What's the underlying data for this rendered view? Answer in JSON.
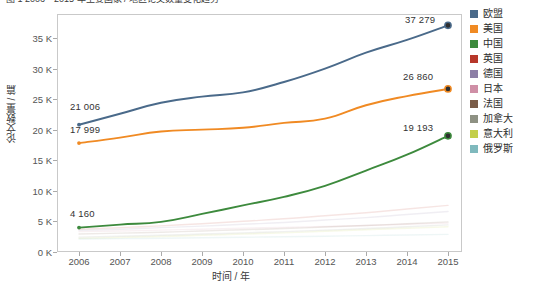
{
  "caption": {
    "text": "图 1  2006—2015 年主要国家 / 地区论文数量变化趋势"
  },
  "axes": {
    "ylabel": "论文数量 / 篇",
    "xlabel": "时间 / 年",
    "yticks": [
      "0 K",
      "5 K",
      "10 K",
      "15 K",
      "20 K",
      "25 K",
      "30 K",
      "35 K"
    ],
    "xticks": [
      "2006",
      "2007",
      "2008",
      "2009",
      "2010",
      "2011",
      "2012",
      "2013",
      "2014",
      "2015"
    ]
  },
  "annotations": [
    {
      "name": "eu-start-value",
      "text": "21 006",
      "x": 70,
      "y": 101
    },
    {
      "name": "us-start-value",
      "text": "17 999",
      "x": 70,
      "y": 124
    },
    {
      "name": "china-start-value",
      "text": "4 160",
      "x": 70,
      "y": 208
    },
    {
      "name": "eu-end-value",
      "text": "37 279",
      "x": 405,
      "y": 14
    },
    {
      "name": "us-end-value",
      "text": "26 860",
      "x": 403,
      "y": 71
    },
    {
      "name": "china-end-value",
      "text": "19 193",
      "x": 403,
      "y": 122
    }
  ],
  "legend": {
    "items": [
      {
        "label": "欧盟",
        "color": "#4a6a8a"
      },
      {
        "label": "美国",
        "color": "#f08a23"
      },
      {
        "label": "中国",
        "color": "#3d8a3d"
      },
      {
        "label": "英国",
        "color": "#b7372a"
      },
      {
        "label": "德国",
        "color": "#8d7fa6"
      },
      {
        "label": "日本",
        "color": "#cf8fa6"
      },
      {
        "label": "法国",
        "color": "#7a5c48"
      },
      {
        "label": "加拿大",
        "color": "#8e9183"
      },
      {
        "label": "意大利",
        "color": "#c3cf4a"
      },
      {
        "label": "俄罗斯",
        "color": "#7fb9bd"
      }
    ]
  },
  "chart_data": {
    "type": "line",
    "title": "图 1  2006—2015 年主要国家 / 地区论文数量变化趋势",
    "xlabel": "时间 / 年",
    "ylabel": "论文数量 / 篇",
    "x": [
      2006,
      2007,
      2008,
      2009,
      2010,
      2011,
      2012,
      2013,
      2014,
      2015
    ],
    "xlim": [
      2006,
      2015
    ],
    "ylim": [
      0,
      37500
    ],
    "ytick_values": [
      0,
      5000,
      10000,
      15000,
      20000,
      25000,
      30000,
      35000
    ],
    "grid": false,
    "legend_position": "right",
    "series": [
      {
        "name": "欧盟",
        "color": "#4a6a8a",
        "emphasis": "strong",
        "values": [
          21006,
          22800,
          24600,
          25600,
          26300,
          28000,
          30200,
          32800,
          34900,
          37279
        ],
        "start_label": "21 006",
        "end_label": "37 279"
      },
      {
        "name": "美国",
        "color": "#f08a23",
        "emphasis": "strong",
        "values": [
          17999,
          18900,
          19900,
          20200,
          20500,
          21300,
          22000,
          24200,
          25700,
          26860
        ],
        "start_label": "17 999",
        "end_label": "26 860"
      },
      {
        "name": "中国",
        "color": "#3d8a3d",
        "emphasis": "strong",
        "values": [
          4160,
          4650,
          5100,
          6400,
          7800,
          9200,
          11000,
          13500,
          16100,
          19193
        ],
        "start_label": "4 160",
        "end_label": "19 193"
      },
      {
        "name": "英国",
        "color": "#b7372a",
        "emphasis": "faded",
        "values": [
          3900,
          4150,
          4450,
          4800,
          5200,
          5600,
          6100,
          6600,
          7200,
          7800
        ]
      },
      {
        "name": "德国",
        "color": "#8d7fa6",
        "emphasis": "faded",
        "values": [
          3700,
          3900,
          4150,
          4400,
          4700,
          5000,
          5400,
          5800,
          6300,
          6800
        ]
      },
      {
        "name": "日本",
        "color": "#cf8fa6",
        "emphasis": "faded",
        "values": [
          3500,
          3600,
          3750,
          3900,
          4050,
          4200,
          4350,
          4500,
          4700,
          4900
        ]
      },
      {
        "name": "法国",
        "color": "#7a5c48",
        "emphasis": "faded",
        "values": [
          3100,
          3250,
          3400,
          3600,
          3800,
          4000,
          4250,
          4500,
          4800,
          5100
        ]
      },
      {
        "name": "加拿大",
        "color": "#8e9183",
        "emphasis": "faded",
        "values": [
          2600,
          2750,
          2900,
          3100,
          3300,
          3500,
          3750,
          4000,
          4300,
          4600
        ]
      },
      {
        "name": "意大利",
        "color": "#c3cf4a",
        "emphasis": "faded",
        "values": [
          2400,
          2550,
          2700,
          2900,
          3100,
          3300,
          3550,
          3800,
          4050,
          4300
        ]
      },
      {
        "name": "俄罗斯",
        "color": "#7fb9bd",
        "emphasis": "faded",
        "values": [
          2300,
          2350,
          2420,
          2500,
          2580,
          2650,
          2750,
          2850,
          2950,
          3050
        ]
      }
    ]
  }
}
